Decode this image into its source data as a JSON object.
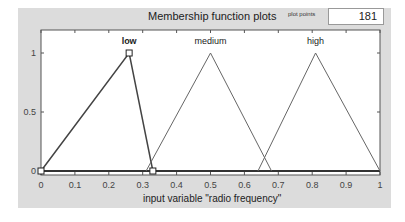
{
  "header": {
    "title": "Membership function plots",
    "plot_points_label": "plot points",
    "plot_points_value": "181"
  },
  "chart_data": {
    "type": "line",
    "title": "Membership function plots",
    "xlabel": "input variable \"radio frequency\"",
    "ylabel": "",
    "xlim": [
      0,
      1
    ],
    "ylim": [
      0,
      1.1
    ],
    "x_ticks": [
      "0",
      "0.1",
      "0.2",
      "0.3",
      "0.4",
      "0.5",
      "0.6",
      "0.7",
      "0.8",
      "0.9",
      "1"
    ],
    "y_ticks": [
      "0",
      "0.5",
      "1"
    ],
    "grid": false,
    "series": [
      {
        "name": "low",
        "shape": "trimf",
        "x": [
          0,
          0.26,
          0.33
        ],
        "y": [
          0,
          1,
          0
        ],
        "selected": true
      },
      {
        "name": "medium",
        "shape": "trimf",
        "x": [
          0.31,
          0.5,
          0.68
        ],
        "y": [
          0,
          1,
          0
        ]
      },
      {
        "name": "high",
        "shape": "trimf",
        "x": [
          0.64,
          0.81,
          1.0
        ],
        "y": [
          0,
          1,
          0
        ]
      }
    ]
  }
}
